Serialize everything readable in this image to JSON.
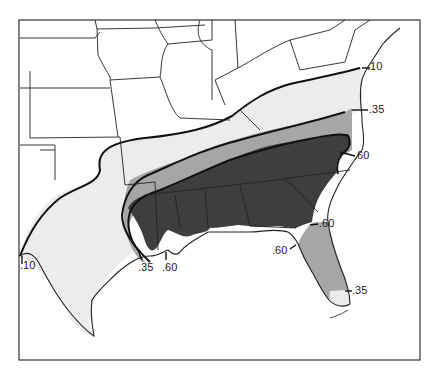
{
  "map": {
    "type": "choropleth-zones",
    "region": "Southeastern United States",
    "colors": {
      "background": "#ffffff",
      "zone_010": "#ececec",
      "zone_035": "#a6a6a6",
      "zone_060": "#3e3e3e",
      "lines": "#1a1a1a"
    },
    "zones": [
      {
        "id": "zone-010",
        "value": ".10",
        "shade": "light gray"
      },
      {
        "id": "zone-035",
        "value": ".35",
        "shade": "medium gray"
      },
      {
        "id": "zone-060",
        "value": ".60",
        "shade": "dark gray"
      }
    ],
    "labels": {
      "va_010": ".10",
      "nc_035": ".35",
      "nc_060": ".60",
      "tx_010": ".10",
      "tx_035": ".35",
      "la_060": ".60",
      "ga_060": ".60",
      "fl_060": ".60",
      "fl_035": ".35"
    }
  }
}
